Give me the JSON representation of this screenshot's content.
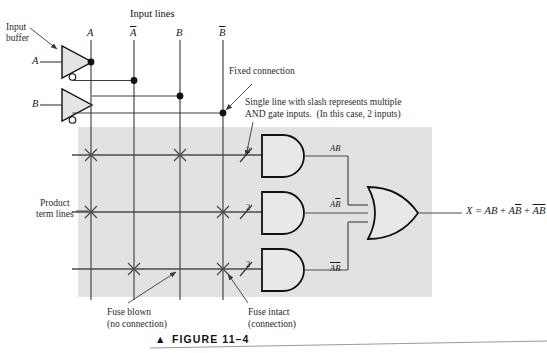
{
  "figure": {
    "caption": "FIGURE 11–4",
    "caption_marker": "▲",
    "background_panel_color": "#e2e2e2",
    "line_color": "#3a3a3a",
    "ink_color": "#1c1c1c"
  },
  "headings": {
    "input_lines": "Input lines",
    "input_buffer": "Input\nbuffer",
    "product_term_lines": "Product\nterm lines"
  },
  "inputs": [
    {
      "name": "A",
      "label": "A"
    },
    {
      "name": "B",
      "label": "B"
    }
  ],
  "input_lines": [
    {
      "label": "A",
      "bar": false
    },
    {
      "label": "A",
      "bar": true
    },
    {
      "label": "B",
      "bar": false
    },
    {
      "label": "B",
      "bar": true
    }
  ],
  "callouts": {
    "fixed_connection": "Fixed connection",
    "slash_note_line1": "Single line with slash represents multiple",
    "slash_note_line2": "AND gate inputs.  (In this case, 2 inputs)",
    "fuse_blown_line1": "Fuse blown",
    "fuse_blown_line2": "(no connection)",
    "fuse_intact_line1": "Fuse intact",
    "fuse_intact_line2": "(connection)"
  },
  "and_gates": [
    {
      "input_count": "2",
      "output_terms": [
        {
          "text": "A",
          "bar": false
        },
        {
          "text": "B",
          "bar": false
        }
      ]
    },
    {
      "input_count": "2",
      "output_terms": [
        {
          "text": "A",
          "bar": false
        },
        {
          "text": "B",
          "bar": true
        }
      ]
    },
    {
      "input_count": "2",
      "output_terms": [
        {
          "text": "A",
          "bar": true
        },
        {
          "text": "B",
          "bar": true
        }
      ]
    }
  ],
  "crosspoints": {
    "legend": {
      "blown": "X",
      "intact": "dot"
    },
    "rows": [
      {
        "product_row": 1,
        "states": [
          "blown",
          "intact",
          "blown",
          "intact"
        ]
      },
      {
        "product_row": 2,
        "states": [
          "blown",
          "intact",
          "intact",
          "blown"
        ]
      },
      {
        "product_row": 3,
        "states": [
          "intact",
          "blown",
          "intact",
          "blown"
        ]
      }
    ]
  },
  "output": {
    "equation_prefix": "X = ",
    "terms": [
      [
        {
          "text": "A",
          "bar": false
        },
        {
          "text": "B",
          "bar": false
        }
      ],
      [
        {
          "text": "A",
          "bar": false
        },
        {
          "text": "B",
          "bar": true
        }
      ],
      [
        {
          "text": "A",
          "bar": true
        },
        {
          "text": "B",
          "bar": true
        }
      ]
    ],
    "equation_plain": "X = AB + AB̅ + A̅B̅"
  }
}
